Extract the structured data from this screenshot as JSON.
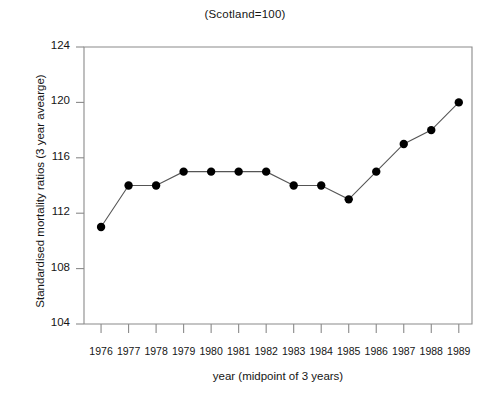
{
  "chart_data": {
    "type": "line",
    "title": "(Scotland=100)",
    "xlabel": "year (midpoint of 3 years)",
    "ylabel": "Standardised mortality ratios (3 year avearge)",
    "categories": [
      "1976",
      "1977",
      "1978",
      "1979",
      "1980",
      "1981",
      "1982",
      "1983",
      "1984",
      "1985",
      "1986",
      "1987",
      "1988",
      "1989"
    ],
    "values": [
      111,
      114,
      114,
      115,
      115,
      115,
      115,
      114,
      114,
      113,
      115,
      117,
      118,
      120
    ],
    "series": [
      {
        "name": "Standardised mortality ratio",
        "values": [
          111,
          114,
          114,
          115,
          115,
          115,
          115,
          114,
          114,
          113,
          115,
          117,
          118,
          120
        ]
      }
    ],
    "ylim": [
      104,
      124
    ],
    "yticks": [
      104,
      108,
      112,
      116,
      120,
      124
    ],
    "ytick_labels": [
      "104",
      "108",
      "112",
      "116",
      "120",
      "124"
    ],
    "xticks": [
      "1976",
      "1977",
      "1978",
      "1979",
      "1980",
      "1981",
      "1982",
      "1983",
      "1984",
      "1985",
      "1986",
      "1987",
      "1988",
      "1989"
    ],
    "grid": false,
    "legend": "none",
    "marker": "filled-circle",
    "line_color": "#555555",
    "marker_color": "#000000",
    "axis_color": "#8a8a8a",
    "text_color": "#151515"
  }
}
